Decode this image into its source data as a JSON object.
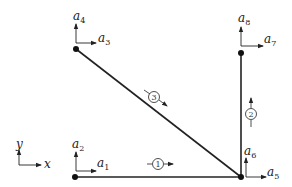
{
  "diagram": {
    "type": "truss-structure",
    "colors": {
      "stroke": "#222222",
      "background": "#ffffff"
    },
    "global_axes": {
      "x_label": "x",
      "y_label": "y"
    },
    "nodes": [
      {
        "id": "bottom-left",
        "x": 75,
        "y": 177,
        "dofs": {
          "horizontal": "a",
          "horizontal_sub": "1",
          "vertical": "a",
          "vertical_sub": "2"
        }
      },
      {
        "id": "top-left",
        "x": 76,
        "y": 49,
        "dofs": {
          "horizontal": "a",
          "horizontal_sub": "3",
          "vertical": "a",
          "vertical_sub": "4"
        }
      },
      {
        "id": "bottom-right",
        "x": 241,
        "y": 177,
        "dofs": {
          "horizontal": "a",
          "horizontal_sub": "5",
          "vertical": "a",
          "vertical_sub": "6"
        }
      },
      {
        "id": "top-right",
        "x": 241,
        "y": 53,
        "dofs": {
          "horizontal": "a",
          "horizontal_sub": "7",
          "vertical": "a",
          "vertical_sub": "8"
        }
      }
    ],
    "elements": [
      {
        "label": "1",
        "from": "bottom-left",
        "to": "bottom-right"
      },
      {
        "label": "2",
        "from": "bottom-right",
        "to": "top-right"
      },
      {
        "label": "3",
        "from": "top-left",
        "to": "bottom-right"
      }
    ]
  }
}
